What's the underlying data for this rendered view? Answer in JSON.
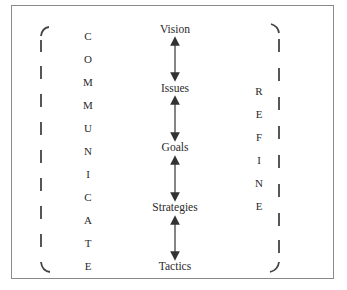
{
  "diagram": {
    "stages": [
      {
        "label": "Vision",
        "y": 30
      },
      {
        "label": "Issues",
        "y": 88
      },
      {
        "label": "Goals",
        "y": 147
      },
      {
        "label": "Strategies",
        "y": 207
      },
      {
        "label": "Tactics",
        "y": 265
      }
    ],
    "left_word": {
      "word": "COMMUNICATE",
      "letters": [
        "C",
        "O",
        "M",
        "M",
        "U",
        "N",
        "I",
        "C",
        "A",
        "T",
        "E"
      ]
    },
    "right_word": {
      "word": "REFINE",
      "letters": [
        "R",
        "E",
        "F",
        "I",
        "N",
        "E"
      ]
    },
    "colors": {
      "text": "#2a2a2a",
      "arrow": "#333333",
      "bracket": "#444444",
      "frame": "#8a8a8a"
    }
  }
}
